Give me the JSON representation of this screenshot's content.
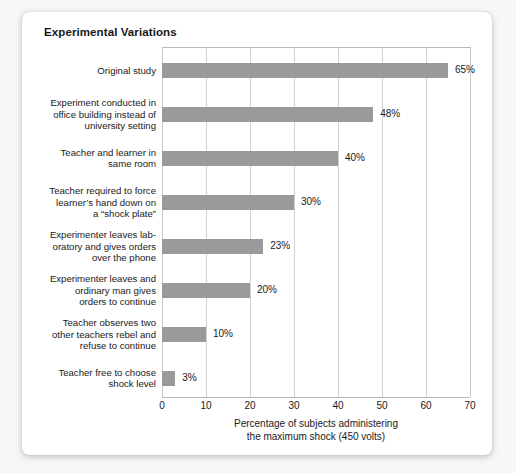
{
  "card": {
    "title": "Experimental Variations"
  },
  "chart_data": {
    "type": "bar",
    "orientation": "horizontal",
    "title": "Experimental Variations",
    "xlabel": "Percentage of subjects administering the maximum shock (450 volts)",
    "xlabel_lines": [
      "Percentage of subjects administering",
      "the maximum shock (450 volts)"
    ],
    "ylabel": "",
    "xlim": [
      0,
      70
    ],
    "xticks": [
      0,
      10,
      20,
      30,
      40,
      50,
      60,
      70
    ],
    "xtick_labels": [
      "0",
      "10",
      "20",
      "30",
      "40",
      "50",
      "60",
      "70"
    ],
    "grid": "vertical",
    "legend": "none",
    "bar_color": "#9a9a9a",
    "categories": [
      "Original study",
      "Experiment conducted in office building instead of university setting",
      "Teacher and learner in same room",
      "Teacher required to force learner’s hand down on a “shock plate”",
      "Experimenter leaves laboratory and gives orders over the phone",
      "Experimenter leaves and ordinary man gives orders to continue",
      "Teacher observes two other teachers rebel and refuse to continue",
      "Teacher free to choose shock level"
    ],
    "category_lines": [
      [
        "Original study"
      ],
      [
        "Experiment conducted in",
        "office building instead of",
        "university setting"
      ],
      [
        "Teacher and learner in",
        "same room"
      ],
      [
        "Teacher required to force",
        "learner’s hand down on",
        "a “shock plate”"
      ],
      [
        "Experimenter leaves lab-",
        "oratory and gives orders",
        "over the phone"
      ],
      [
        "Experimenter leaves and",
        "ordinary man gives",
        "orders to continue"
      ],
      [
        "Teacher observes two",
        "other teachers rebel and",
        "refuse to continue"
      ],
      [
        "Teacher free to choose",
        "shock level"
      ]
    ],
    "values": [
      65,
      48,
      40,
      30,
      23,
      20,
      10,
      3
    ],
    "value_labels": [
      "65%",
      "48%",
      "40%",
      "30%",
      "23%",
      "20%",
      "10%",
      "3%"
    ]
  }
}
